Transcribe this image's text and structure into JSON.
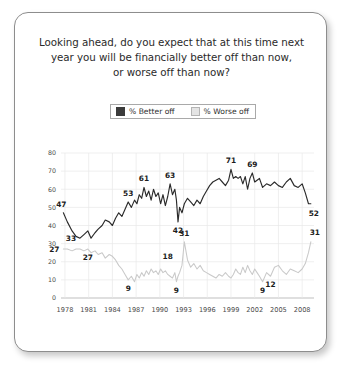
{
  "card": {
    "title_lines": [
      "Looking ahead, do you expect that at this time next",
      "year you will be financially better off than now,",
      "or worse off than now?"
    ]
  },
  "legend": {
    "position": "top-center",
    "items": [
      {
        "label": "% Better off",
        "swatch": "dark-square-swatch",
        "color": "#3b3b3b"
      },
      {
        "label": "% Worse off",
        "swatch": "light-square-swatch",
        "color": "#e4e4e4"
      }
    ]
  },
  "chart_data": {
    "type": "line",
    "title": "Looking ahead, do you expect that at this time next year you will be financially better off than now, or worse off than now?",
    "xlabel": "",
    "ylabel": "",
    "ylim": [
      0,
      80
    ],
    "xlim": [
      1977.5,
      2009.5
    ],
    "grid": true,
    "yticks": [
      0,
      10,
      20,
      30,
      40,
      50,
      60,
      70,
      80
    ],
    "xticks": [
      1978,
      1981,
      1984,
      1987,
      1990,
      1993,
      1996,
      1999,
      2002,
      2005,
      2008
    ],
    "series": [
      {
        "name": "% Better off",
        "color": "#2b2b2b",
        "x": [
          1977.8,
          1978.3,
          1978.9,
          1979.4,
          1979.9,
          1980.4,
          1980.9,
          1981.3,
          1981.8,
          1982.2,
          1982.7,
          1983.1,
          1983.6,
          1984.0,
          1984.4,
          1984.8,
          1985.2,
          1985.6,
          1986.0,
          1986.4,
          1986.8,
          1987.1,
          1987.4,
          1987.7,
          1988.0,
          1988.3,
          1988.6,
          1988.9,
          1989.2,
          1989.5,
          1989.8,
          1990.1,
          1990.4,
          1990.7,
          1991.0,
          1991.3,
          1991.6,
          1991.9,
          1992.1,
          1992.3,
          1992.5,
          1992.8,
          1993.1,
          1993.5,
          1993.9,
          1994.3,
          1994.7,
          1995.1,
          1995.5,
          1995.9,
          1996.3,
          1996.7,
          1997.1,
          1997.5,
          1997.9,
          1998.3,
          1998.7,
          1999.0,
          1999.3,
          1999.6,
          1999.9,
          2000.2,
          2000.5,
          2000.8,
          2001.1,
          2001.4,
          2001.7,
          2002.0,
          2002.3,
          2002.6,
          2003.0,
          2003.5,
          2004.0,
          2004.5,
          2005.0,
          2005.5,
          2006.0,
          2006.5,
          2007.0,
          2007.5,
          2008.0,
          2008.4,
          2008.8,
          2009.1
        ],
        "y": [
          47,
          42,
          37,
          34,
          33,
          35,
          37,
          33,
          36,
          38,
          40,
          43,
          42,
          40,
          44,
          47,
          45,
          49,
          53,
          50,
          54,
          52,
          57,
          55,
          61,
          56,
          59,
          54,
          60,
          56,
          58,
          52,
          57,
          51,
          56,
          63,
          57,
          60,
          54,
          42,
          50,
          47,
          52,
          55,
          53,
          51,
          54,
          52,
          56,
          59,
          62,
          64,
          65,
          66,
          64,
          62,
          65,
          71,
          66,
          67,
          66,
          67,
          63,
          67,
          60,
          66,
          69,
          64,
          65,
          66,
          61,
          63,
          62,
          64,
          62,
          61,
          64,
          66,
          62,
          61,
          63,
          58,
          52,
          52
        ],
        "annotations": [
          {
            "x": 1977.8,
            "y": 47,
            "label": "47",
            "pos": "above-left"
          },
          {
            "x": 1979.9,
            "y": 33,
            "label": "33",
            "pos": "left"
          },
          {
            "x": 1980.9,
            "y": 27,
            "label": "27",
            "pos": "below"
          },
          {
            "x": 1986.0,
            "y": 53,
            "label": "53",
            "pos": "above"
          },
          {
            "x": 1988.0,
            "y": 61,
            "label": "61",
            "pos": "above"
          },
          {
            "x": 1991.3,
            "y": 63,
            "label": "63",
            "pos": "above"
          },
          {
            "x": 1992.3,
            "y": 42,
            "label": "42",
            "pos": "below"
          },
          {
            "x": 1999.0,
            "y": 71,
            "label": "71",
            "pos": "above"
          },
          {
            "x": 2001.7,
            "y": 69,
            "label": "69",
            "pos": "above"
          },
          {
            "x": 2009.1,
            "y": 52,
            "label": "52",
            "pos": "below-right"
          }
        ]
      },
      {
        "name": "% Worse off",
        "color": "#c9c9c9",
        "x": [
          1977.8,
          1978.3,
          1978.9,
          1979.4,
          1979.9,
          1980.4,
          1980.9,
          1981.3,
          1981.8,
          1982.2,
          1982.7,
          1983.1,
          1983.6,
          1984.0,
          1984.4,
          1984.8,
          1985.2,
          1985.6,
          1986.0,
          1986.4,
          1986.8,
          1987.1,
          1987.4,
          1987.7,
          1988.0,
          1988.3,
          1988.6,
          1988.9,
          1989.2,
          1989.5,
          1989.8,
          1990.1,
          1990.4,
          1990.7,
          1991.0,
          1991.3,
          1991.6,
          1991.9,
          1992.1,
          1992.3,
          1992.5,
          1992.8,
          1993.1,
          1993.5,
          1993.9,
          1994.3,
          1994.7,
          1995.1,
          1995.5,
          1995.9,
          1996.3,
          1996.7,
          1997.1,
          1997.5,
          1997.9,
          1998.3,
          1998.7,
          1999.0,
          1999.3,
          1999.6,
          1999.9,
          2000.2,
          2000.5,
          2000.8,
          2001.1,
          2001.4,
          2001.7,
          2002.0,
          2002.3,
          2002.6,
          2003.0,
          2003.5,
          2004.0,
          2004.5,
          2005.0,
          2005.5,
          2006.0,
          2006.5,
          2007.0,
          2007.5,
          2008.0,
          2008.4,
          2008.8,
          2009.1
        ],
        "y": [
          27,
          27,
          26,
          27,
          27,
          26,
          27,
          25,
          26,
          24,
          25,
          22,
          24,
          23,
          21,
          18,
          16,
          13,
          10,
          12,
          9,
          13,
          11,
          14,
          12,
          15,
          13,
          16,
          14,
          15,
          13,
          16,
          14,
          15,
          13,
          12,
          11,
          14,
          9,
          12,
          14,
          18,
          31,
          21,
          17,
          19,
          16,
          18,
          15,
          14,
          13,
          12,
          11,
          13,
          12,
          14,
          12,
          11,
          13,
          16,
          14,
          13,
          17,
          14,
          18,
          15,
          13,
          16,
          14,
          12,
          9,
          14,
          12,
          17,
          18,
          15,
          13,
          16,
          15,
          14,
          16,
          19,
          25,
          31
        ],
        "annotations": [
          {
            "x": 1977.8,
            "y": 27,
            "label": "27",
            "pos": "left"
          },
          {
            "x": 1986.0,
            "y": 10,
            "label": "9",
            "pos": "below"
          },
          {
            "x": 1992.1,
            "y": 9,
            "label": "9",
            "pos": "below"
          },
          {
            "x": 1991.0,
            "y": 18,
            "label": "18",
            "pos": "above"
          },
          {
            "x": 1993.1,
            "y": 31,
            "label": "31",
            "pos": "above"
          },
          {
            "x": 2003.0,
            "y": 9,
            "label": "9",
            "pos": "below"
          },
          {
            "x": 2004.0,
            "y": 12,
            "label": "12",
            "pos": "below"
          },
          {
            "x": 2009.1,
            "y": 31,
            "label": "31",
            "pos": "above-right"
          }
        ]
      }
    ]
  },
  "colors": {
    "better_line": "#2b2b2b",
    "worse_line": "#c9c9c9",
    "grid": "#e8e8e8",
    "axis_text": "#4a4a4a",
    "card_border": "#8d8d8d"
  }
}
